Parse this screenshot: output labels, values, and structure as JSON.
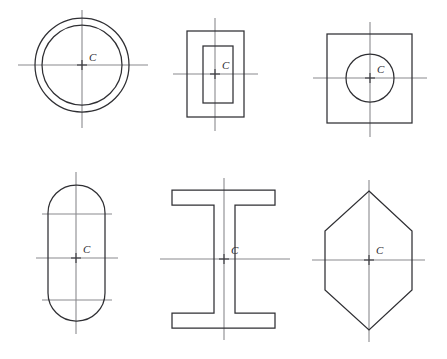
{
  "figure": {
    "background_color": "#ffffff",
    "outline_color": "#2f2f33",
    "axis_color": "#8a8a8e",
    "centroid_mark_color": "#3a3a3e",
    "label_color": "#2b2b2f",
    "centroid_label": "C",
    "rows": 2,
    "columns": 3
  },
  "shapes": [
    {
      "id": "annulus",
      "name": "hollow-circle",
      "label": "C",
      "row": 1,
      "column": 1,
      "center": {
        "x": 82,
        "y": 65
      },
      "outer_radius": 47,
      "inner_radius": 40,
      "horizontal_axis": {
        "x1": 18,
        "x2": 148,
        "y": 65
      },
      "vertical_axis": {
        "x": 82,
        "y1": 10,
        "y2": 128
      },
      "label_offset": {
        "x": 7,
        "y": -4
      }
    },
    {
      "id": "hollow-rectangle",
      "name": "rectangular-tube",
      "label": "C",
      "row": 1,
      "column": 2,
      "center": {
        "x": 215,
        "y": 74
      },
      "outer": {
        "x": 187,
        "y": 31,
        "width": 57,
        "height": 86
      },
      "inner": {
        "x": 203,
        "y": 46,
        "width": 30,
        "height": 57
      },
      "horizontal_axis": {
        "x1": 173,
        "x2": 258,
        "y": 74
      },
      "vertical_axis": {
        "x": 215,
        "y1": 18,
        "y2": 131
      },
      "label_offset": {
        "x": 7,
        "y": -5
      }
    },
    {
      "id": "square-with-hole",
      "name": "square-with-circular-hole",
      "label": "C",
      "row": 1,
      "column": 3,
      "center": {
        "x": 370,
        "y": 78
      },
      "square": {
        "x": 327,
        "y": 34,
        "width": 85,
        "height": 89
      },
      "hole_radius": 24,
      "horizontal_axis": {
        "x1": 313,
        "x2": 427,
        "y": 78
      },
      "vertical_axis": {
        "x": 370,
        "y1": 22,
        "y2": 137
      },
      "label_offset": {
        "x": 7,
        "y": -5
      }
    },
    {
      "id": "stadium",
      "name": "obround-rounded-rectangle",
      "label": "C",
      "row": 2,
      "column": 1,
      "center": {
        "x": 76,
        "y": 258
      },
      "body": {
        "x": 48,
        "y": 185,
        "width": 57,
        "height": 136
      },
      "corner_radius": 28,
      "horizontal_axis": {
        "x1": 36,
        "x2": 118,
        "y": 258
      },
      "upper_axis": {
        "x1": 42,
        "x2": 112,
        "y": 214
      },
      "lower_axis": {
        "x1": 42,
        "x2": 112,
        "y": 300
      },
      "vertical_axis": {
        "x": 76,
        "y1": 172,
        "y2": 334
      },
      "label_offset": {
        "x": 7,
        "y": -5
      }
    },
    {
      "id": "i-beam",
      "name": "wide-flange-i-section",
      "label": "C",
      "row": 2,
      "column": 2,
      "center": {
        "x": 224,
        "y": 259
      },
      "flange_left": 172,
      "flange_right": 275,
      "top_flange": {
        "y_top": 190,
        "y_bottom": 205
      },
      "bottom_flange": {
        "y_top": 313,
        "y_bottom": 328
      },
      "web_left": 214,
      "web_right": 235,
      "horizontal_axis": {
        "x1": 160,
        "x2": 290,
        "y": 259
      },
      "vertical_axis": {
        "x": 224,
        "y1": 178,
        "y2": 340
      },
      "label_offset": {
        "x": 7,
        "y": -5
      }
    },
    {
      "id": "hexagon",
      "name": "elongated-hexagon",
      "label": "C",
      "row": 2,
      "column": 3,
      "center": {
        "x": 369,
        "y": 260
      },
      "apex_top": {
        "x": 369,
        "y": 191
      },
      "apex_bottom": {
        "x": 369,
        "y": 330
      },
      "left_x": 325,
      "right_x": 412,
      "side_y_top": 231,
      "side_y_bottom": 290,
      "horizontal_axis": {
        "x1": 312,
        "x2": 425,
        "y": 260
      },
      "vertical_axis": {
        "x": 369,
        "y1": 180,
        "y2": 342
      },
      "label_offset": {
        "x": 7,
        "y": -6
      }
    }
  ]
}
